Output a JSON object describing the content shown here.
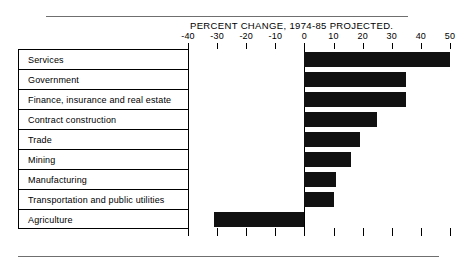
{
  "chart_data": {
    "type": "bar",
    "orientation": "horizontal",
    "title": "PERCENT CHANGE, 1974-85 PROJECTED.",
    "xlabel": "",
    "ylabel": "",
    "xlim": [
      -40,
      50
    ],
    "grid": false,
    "legend": null,
    "axis_ticks": [
      -40,
      -30,
      -20,
      -10,
      0,
      10,
      20,
      30,
      40,
      50
    ],
    "tick_labels": [
      "-40",
      "-30",
      "-20",
      "-10",
      "0",
      "10",
      "20",
      "30",
      "40",
      "50"
    ],
    "categories": [
      "Services",
      "Government",
      "Finance, insurance and real estate",
      "Contract construction",
      "Trade",
      "Mining",
      "Manufacturing",
      "Transportation and public utilities",
      "Agriculture"
    ],
    "values": [
      50,
      35,
      35,
      25,
      19,
      16,
      11,
      10,
      -31
    ],
    "bar_color": "#111111"
  },
  "figure": {
    "title": "PERCENT CHANGE, 1974-85 PROJECTED."
  }
}
